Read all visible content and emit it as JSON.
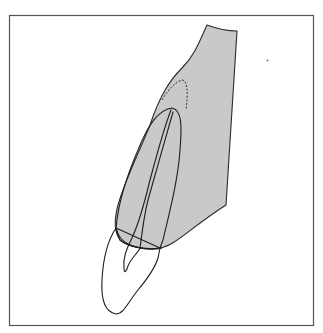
{
  "figure": {
    "colors": {
      "background": "#ffffff",
      "frame": "#555555",
      "gum_tissue": "#c9c9c9",
      "tooth": "#e8e8e8",
      "outline": "#1e1e1e"
    },
    "elements": [
      {
        "id": "frame",
        "label": "border frame"
      },
      {
        "id": "soft-tissue",
        "label": "gingiva / alveolar tissue (grey)"
      },
      {
        "id": "root",
        "label": "tooth root"
      },
      {
        "id": "crown",
        "label": "tooth crown"
      },
      {
        "id": "pulp-canal",
        "label": "pulp canal"
      },
      {
        "id": "dashed-contour",
        "label": "dashed apical contour"
      },
      {
        "id": "speck",
        "label": "small dot mark"
      }
    ]
  }
}
